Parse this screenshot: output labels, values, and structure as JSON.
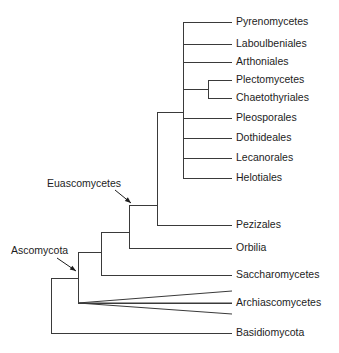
{
  "figure": {
    "kind": "cladogram",
    "background_color": "#ffffff",
    "line_color": "#3a3a3a",
    "text_color": "#1d1d1d"
  },
  "tips": [
    {
      "name": "tip-pyrenomycetes",
      "label": "Pyrenomycetes",
      "y": 22,
      "x_start": 183,
      "x_end": 232,
      "label_x": 236
    },
    {
      "name": "tip-laboulbeniales",
      "label": "Laboulbeniales",
      "y": 44,
      "x_start": 183,
      "x_end": 232,
      "label_x": 236
    },
    {
      "name": "tip-arthoniales",
      "label": "Arthoniales",
      "y": 62,
      "x_start": 183,
      "x_end": 232,
      "label_x": 236
    },
    {
      "name": "tip-plectomycetes",
      "label": "Plectomycetes",
      "y": 80,
      "x_start": 208,
      "x_end": 232,
      "label_x": 236
    },
    {
      "name": "tip-chaetothyriales",
      "label": "Chaetothyriales",
      "y": 98,
      "x_start": 208,
      "x_end": 232,
      "label_x": 236
    },
    {
      "name": "tip-pleosporales",
      "label": "Pleosporales",
      "y": 118,
      "x_start": 183,
      "x_end": 232,
      "label_x": 236
    },
    {
      "name": "tip-dothideales",
      "label": "Dothideales",
      "y": 138,
      "x_start": 183,
      "x_end": 232,
      "label_x": 236
    },
    {
      "name": "tip-lecanorales",
      "label": "Lecanorales",
      "y": 158,
      "x_start": 183,
      "x_end": 232,
      "label_x": 236
    },
    {
      "name": "tip-helotiales",
      "label": "Helotiales",
      "y": 178,
      "x_start": 183,
      "x_end": 232,
      "label_x": 236
    },
    {
      "name": "tip-pezizales",
      "label": "Pezizales",
      "y": 225,
      "x_start": 157,
      "x_end": 232,
      "label_x": 236
    },
    {
      "name": "tip-orbilia",
      "label": "Orbilia",
      "y": 248,
      "x_start": 129,
      "x_end": 232,
      "label_x": 236
    },
    {
      "name": "tip-saccharomycetes",
      "label": "Saccharomycetes",
      "y": 275,
      "x_start": 101,
      "x_end": 232,
      "label_x": 236
    },
    {
      "name": "tip-archiascomycetes",
      "label": "Archiascomycetes",
      "y": 303,
      "x_start": 78,
      "x_end": 232,
      "label_x": 236
    },
    {
      "name": "tip-basidiomycota",
      "label": "Basidiomycota",
      "y": 333,
      "x_start": 51,
      "x_end": 232,
      "label_x": 236
    }
  ],
  "fan_branches": [
    {
      "name": "fan-archiascomycetes-upper",
      "x1": 78,
      "y1": 303,
      "x2": 232,
      "y2": 291
    },
    {
      "name": "fan-archiascomycetes-middle",
      "x1": 78,
      "y1": 303,
      "x2": 232,
      "y2": 303
    },
    {
      "name": "fan-archiascomycetes-lower",
      "x1": 78,
      "y1": 303,
      "x2": 232,
      "y2": 314
    }
  ],
  "nodes": [
    {
      "name": "node-plectomycetes-clade",
      "x": 208,
      "y_top": 80,
      "y_bottom": 98,
      "stem_from_x": 183,
      "stem_y": 89
    },
    {
      "name": "node-main-trunk",
      "x": 183,
      "y_top": 22,
      "y_bottom": 178,
      "stem_from_x": 157,
      "stem_y": 112
    },
    {
      "name": "node-pezizales-clade",
      "x": 157,
      "y_top": 112,
      "y_bottom": 225,
      "stem_from_x": 129,
      "stem_y": 205
    },
    {
      "name": "node-euascomycetes",
      "x": 129,
      "y_top": 205,
      "y_bottom": 248,
      "stem_from_x": 101,
      "stem_y": 232
    },
    {
      "name": "node-saccharomycetes",
      "x": 101,
      "y_top": 232,
      "y_bottom": 275,
      "stem_from_x": 78,
      "stem_y": 252
    },
    {
      "name": "node-ascomycota",
      "x": 78,
      "y_top": 252,
      "y_bottom": 303,
      "stem_from_x": 51,
      "stem_y": 278
    },
    {
      "name": "node-root",
      "x": 51,
      "y_top": 278,
      "y_bottom": 333,
      "stem_from_x": 51,
      "stem_y": 278
    }
  ],
  "annotations": [
    {
      "name": "clade-annotation-euascomycetes",
      "label": "Euascomycetes",
      "text_x": 47,
      "text_y": 184,
      "pointer": {
        "x1": 115,
        "y1": 190,
        "x2": 131,
        "y2": 203
      }
    },
    {
      "name": "clade-annotation-ascomycota",
      "label": "Ascomycota",
      "text_x": 11,
      "text_y": 251,
      "pointer": {
        "x1": 57,
        "y1": 258,
        "x2": 76,
        "y2": 271
      }
    }
  ]
}
